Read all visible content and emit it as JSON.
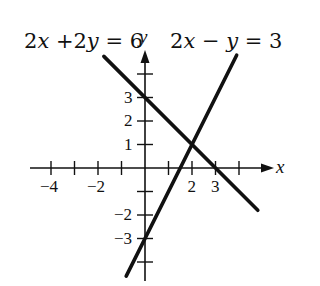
{
  "chart_data": {
    "type": "line",
    "title": "",
    "xlabel": "x",
    "ylabel": "y",
    "xlim": [
      -4.7,
      5.2
    ],
    "ylim": [
      -4.8,
      4.9
    ],
    "grid": false,
    "x_tick_positions": [
      -4,
      -3,
      -2,
      -1,
      1,
      2,
      3,
      4
    ],
    "x_tick_labels": [
      {
        "value": -4,
        "label": "−4"
      },
      {
        "value": -2,
        "label": "−2"
      },
      {
        "value": 2,
        "label": "2"
      },
      {
        "value": 3,
        "label": "3"
      }
    ],
    "y_tick_positions": [
      -4,
      -3,
      -2,
      -1,
      1,
      2,
      3,
      4
    ],
    "y_tick_labels": [
      {
        "value": 3,
        "label": "3"
      },
      {
        "value": 2,
        "label": "2"
      },
      {
        "value": 1,
        "label": "1"
      },
      {
        "value": -2,
        "label": "−2"
      },
      {
        "value": -3,
        "label": "−3"
      }
    ],
    "series": [
      {
        "name": "2x + 2y = 6",
        "equation": "y = 3 - x",
        "x": [
          -1.75,
          4.8
        ],
        "y": [
          4.75,
          -1.8
        ],
        "color": "#111111"
      },
      {
        "name": "2x − y = 3",
        "equation": "y = 2x - 3",
        "x": [
          -0.8,
          3.9
        ],
        "y": [
          -4.6,
          4.8
        ],
        "color": "#111111"
      }
    ],
    "annotations": [
      {
        "text": "2x +2y = 6",
        "near": "line 1, upper left"
      },
      {
        "text": "2x − y = 3",
        "near": "line 2, upper right"
      }
    ],
    "intersection": {
      "x": 2,
      "y": 1
    }
  },
  "labels": {
    "eq1": {
      "a": "2",
      "x": "x",
      "mid": " +2",
      "y": "y",
      "rest": " = 6"
    },
    "eq2": {
      "a": "2",
      "x": "x",
      "mid": " − ",
      "y": "y",
      "rest": " = 3"
    },
    "x_axis": "x",
    "y_axis": "y"
  },
  "colors": {
    "ink": "#111111",
    "background": "#ffffff"
  }
}
